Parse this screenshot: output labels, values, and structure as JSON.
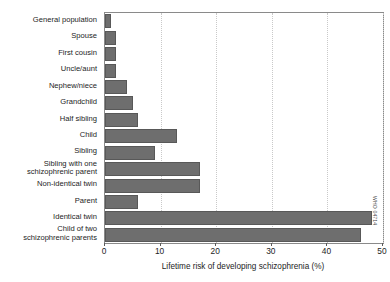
{
  "chart_data": {
    "type": "bar",
    "orientation": "horizontal",
    "title": "",
    "xlabel": "Lifetime risk of developing schizophrenia (%)",
    "ylabel": "",
    "xlim": [
      0,
      50
    ],
    "xticks": [
      0,
      10,
      20,
      30,
      40,
      50
    ],
    "xtick_labels": [
      "0",
      "10",
      "20",
      "30",
      "40",
      "50"
    ],
    "grid": "vertical-dotted",
    "legend": "none",
    "bar_color": "#6e6e6e",
    "categories": [
      "General population",
      "Spouse",
      "First cousin",
      "Uncle/aunt",
      "Nephew/niece",
      "Grandchild",
      "Half sibling",
      "Child",
      "Sibling",
      "Sibling with one\nschizophrenic parent",
      "Non-identical twin",
      "Parent",
      "Identical twin",
      "Child of two\nschizophrenic parents"
    ],
    "values": [
      1,
      2,
      2,
      2,
      4,
      5,
      6,
      13,
      9,
      17,
      17,
      6,
      48,
      46
    ]
  },
  "credit": {
    "text": "WHO 04714"
  }
}
